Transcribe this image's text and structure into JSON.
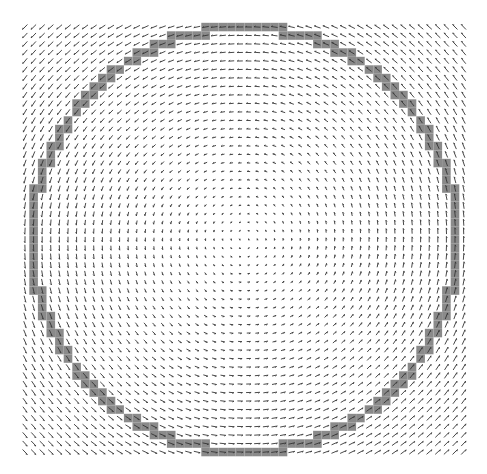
{
  "figure": {
    "type": "vector-field-quiver",
    "width": 487,
    "height": 474
  },
  "grid": {
    "x0": 25,
    "y0": 27,
    "cols": 52,
    "rows": 51,
    "dx": 8.6,
    "dy": 8.5
  },
  "field": {
    "rotation": "counterclockwise",
    "center": [
      244.5,
      239.5
    ],
    "arrow_color": "#333333",
    "arrow_max_len": 7,
    "arrow_min_len": 1.5
  },
  "circle": {
    "center": [
      244.5,
      239.5
    ],
    "radius": 212,
    "cell_fill": "#8a8a8a",
    "cell_tolerance": 0.6
  },
  "colors": {
    "background": "#ffffff"
  }
}
